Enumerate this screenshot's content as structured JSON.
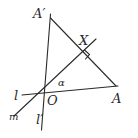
{
  "diagram": {
    "type": "geometry-construction",
    "points": {
      "O": {
        "label": "O",
        "x": 43,
        "y": 93
      },
      "A": {
        "label": "A",
        "x": 116,
        "y": 86
      },
      "A_prime": {
        "label": "A′",
        "x": 50,
        "y": 18
      },
      "X": {
        "label": "X",
        "x": 83,
        "y": 51
      }
    },
    "lines": {
      "l": {
        "label": "l"
      },
      "l_prime": {
        "label": "l′"
      },
      "m": {
        "label": "m"
      }
    },
    "angle": {
      "label": "α"
    },
    "right_angle_at": "X",
    "stroke_color": "#2a2a2a",
    "background": "#ffffff"
  }
}
